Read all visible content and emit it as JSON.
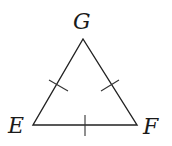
{
  "figure": {
    "type": "equilateral-triangle",
    "vertices": [
      {
        "name": "G",
        "x": 83,
        "y": 39,
        "label_x": 76,
        "label_y": 29
      },
      {
        "name": "E",
        "x": 33,
        "y": 125,
        "label_x": 10,
        "label_y": 134
      },
      {
        "name": "F",
        "x": 137,
        "y": 125,
        "label_x": 143,
        "label_y": 134
      }
    ],
    "sides": [
      {
        "from": "E",
        "to": "G",
        "tick_marks": 1
      },
      {
        "from": "G",
        "to": "F",
        "tick_marks": 1
      },
      {
        "from": "E",
        "to": "F",
        "tick_marks": 1
      }
    ],
    "labels": {
      "G": "G",
      "E": "E",
      "F": "F"
    },
    "stroke_color": "#222222"
  }
}
